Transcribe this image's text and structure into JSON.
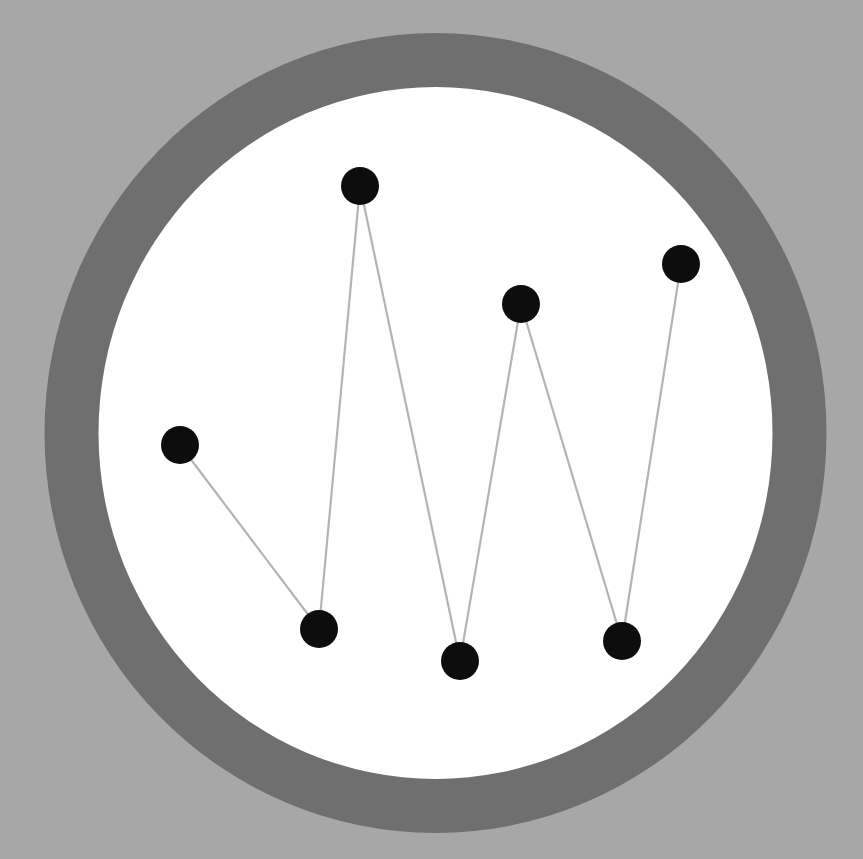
{
  "colors": {
    "background": "#a7a7a7",
    "ring": "#6f6f6f",
    "disc": "#ffffff",
    "edge": "#b4b4b4",
    "node": "#0d0d0d"
  },
  "ring": {
    "cx": 435.5,
    "cy": 433,
    "outer_rx": 391,
    "outer_ry": 400,
    "inner_rx": 337,
    "inner_ry": 346
  },
  "node_radius": 19,
  "nodes": [
    {
      "id": "n1",
      "x": 180,
      "y": 445
    },
    {
      "id": "n2",
      "x": 319,
      "y": 629
    },
    {
      "id": "n3",
      "x": 360,
      "y": 186
    },
    {
      "id": "n4",
      "x": 460,
      "y": 661
    },
    {
      "id": "n5",
      "x": 521,
      "y": 304
    },
    {
      "id": "n6",
      "x": 622,
      "y": 641
    },
    {
      "id": "n7",
      "x": 681,
      "y": 264
    }
  ],
  "edges": [
    [
      "n1",
      "n2"
    ],
    [
      "n2",
      "n3"
    ],
    [
      "n3",
      "n4"
    ],
    [
      "n4",
      "n5"
    ],
    [
      "n5",
      "n6"
    ],
    [
      "n6",
      "n7"
    ]
  ],
  "caption": ""
}
